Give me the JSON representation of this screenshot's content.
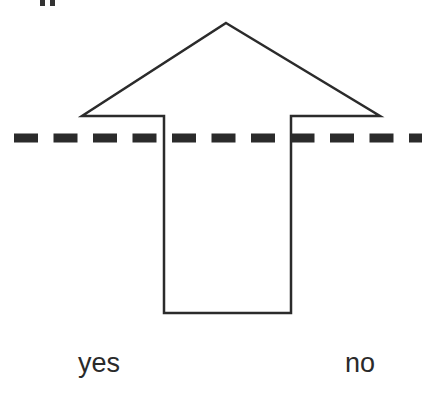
{
  "diagram": {
    "arrow": {
      "direction": "up",
      "tip": [
        226,
        23
      ],
      "left_wing": [
        82,
        116
      ],
      "right_wing": [
        380,
        116
      ],
      "shaft_left_x": 164,
      "shaft_right_x": 291,
      "shaft_bottom_y": 313,
      "stroke_color": "#2b2b2b",
      "fill_color": "#ffffff"
    },
    "threshold_line": {
      "style": "dashed",
      "y": 138,
      "color": "#2b2b2b",
      "dash_length": 24,
      "gap_length": 15.5,
      "thickness": 9
    },
    "labels": {
      "left": "yes",
      "right": "no"
    }
  }
}
